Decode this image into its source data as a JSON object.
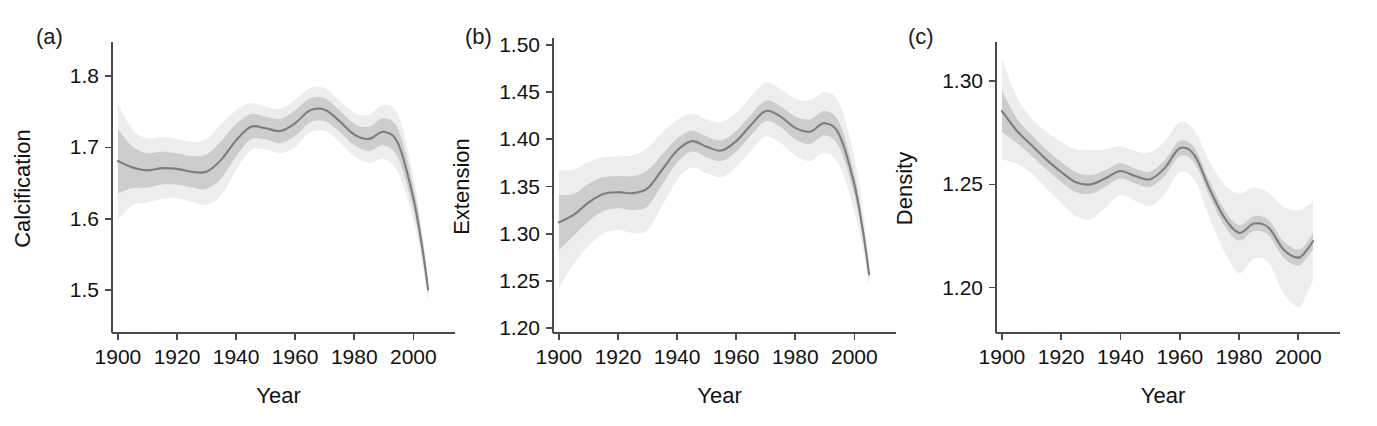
{
  "figure": {
    "title": "",
    "panel_count": 3,
    "background_color": "#ffffff",
    "line_color": "#7d7d7d",
    "inner_band_color": "#cdcdcd",
    "outer_band_color": "#ededed"
  },
  "chart_data": [
    {
      "type": "line",
      "panel_label": "(a)",
      "title": "",
      "xlabel": "Year",
      "ylabel": "Calcification",
      "xlim": [
        1898,
        2008
      ],
      "ylim": [
        1.44,
        1.845
      ],
      "xticks": [
        1900,
        1920,
        1940,
        1960,
        1980,
        2000
      ],
      "xticklabels": [
        "1900",
        "1920",
        "1940",
        "1960",
        "1980",
        "2000"
      ],
      "yticks": [
        1.5,
        1.6,
        1.7,
        1.8
      ],
      "yticklabels": [
        "1.5",
        "1.6",
        "1.7",
        "1.8"
      ],
      "grid": false,
      "legend": "none",
      "x": [
        1900,
        1905,
        1910,
        1915,
        1920,
        1925,
        1930,
        1935,
        1940,
        1945,
        1950,
        1955,
        1960,
        1965,
        1970,
        1975,
        1980,
        1985,
        1990,
        1995,
        2000,
        2003,
        2005
      ],
      "series": [
        {
          "name": "fit",
          "values": [
            1.681,
            1.672,
            1.668,
            1.671,
            1.67,
            1.666,
            1.666,
            1.683,
            1.71,
            1.729,
            1.727,
            1.723,
            1.734,
            1.752,
            1.753,
            1.737,
            1.718,
            1.712,
            1.722,
            1.704,
            1.629,
            1.56,
            1.501
          ]
        },
        {
          "name": "inner_lower",
          "values": [
            1.636,
            1.643,
            1.644,
            1.648,
            1.648,
            1.644,
            1.642,
            1.657,
            1.687,
            1.711,
            1.711,
            1.706,
            1.716,
            1.735,
            1.737,
            1.722,
            1.703,
            1.695,
            1.703,
            1.684,
            1.613,
            1.548,
            1.492
          ]
        },
        {
          "name": "inner_upper",
          "values": [
            1.726,
            1.701,
            1.692,
            1.694,
            1.692,
            1.688,
            1.69,
            1.709,
            1.733,
            1.747,
            1.743,
            1.74,
            1.752,
            1.769,
            1.769,
            1.752,
            1.733,
            1.729,
            1.741,
            1.724,
            1.645,
            1.572,
            1.51
          ]
        },
        {
          "name": "outer_lower",
          "values": [
            1.6,
            1.619,
            1.623,
            1.628,
            1.629,
            1.624,
            1.62,
            1.633,
            1.668,
            1.696,
            1.697,
            1.692,
            1.701,
            1.721,
            1.723,
            1.708,
            1.688,
            1.678,
            1.684,
            1.664,
            1.598,
            1.537,
            1.484
          ]
        },
        {
          "name": "outer_upper",
          "values": [
            1.762,
            1.725,
            1.713,
            1.715,
            1.712,
            1.708,
            1.712,
            1.733,
            1.752,
            1.762,
            1.757,
            1.754,
            1.767,
            1.783,
            1.783,
            1.766,
            1.748,
            1.746,
            1.76,
            1.744,
            1.66,
            1.583,
            1.518
          ]
        }
      ]
    },
    {
      "type": "line",
      "panel_label": "(b)",
      "title": "",
      "xlabel": "Year",
      "ylabel": "Extension",
      "xlim": [
        1898,
        2008
      ],
      "ylim": [
        1.195,
        1.505
      ],
      "xticks": [
        1900,
        1920,
        1940,
        1960,
        1980,
        2000
      ],
      "xticklabels": [
        "1900",
        "1920",
        "1940",
        "1960",
        "1980",
        "2000"
      ],
      "yticks": [
        1.2,
        1.25,
        1.3,
        1.35,
        1.4,
        1.45,
        1.5
      ],
      "yticklabels": [
        "1.20",
        "1.25",
        "1.30",
        "1.35",
        "1.40",
        "1.45",
        "1.50"
      ],
      "grid": false,
      "legend": "none",
      "x": [
        1900,
        1905,
        1910,
        1915,
        1920,
        1925,
        1930,
        1935,
        1940,
        1945,
        1950,
        1955,
        1960,
        1965,
        1970,
        1975,
        1980,
        1985,
        1990,
        1995,
        2000,
        2003,
        2005
      ],
      "series": [
        {
          "name": "fit",
          "values": [
            1.312,
            1.32,
            1.333,
            1.342,
            1.344,
            1.343,
            1.348,
            1.368,
            1.388,
            1.398,
            1.392,
            1.388,
            1.398,
            1.415,
            1.43,
            1.424,
            1.412,
            1.408,
            1.417,
            1.404,
            1.352,
            1.301,
            1.257
          ]
        },
        {
          "name": "inner_lower",
          "values": [
            1.283,
            1.298,
            1.313,
            1.324,
            1.327,
            1.325,
            1.329,
            1.352,
            1.375,
            1.387,
            1.381,
            1.377,
            1.387,
            1.404,
            1.419,
            1.413,
            1.4,
            1.395,
            1.404,
            1.391,
            1.341,
            1.293,
            1.252
          ]
        },
        {
          "name": "inner_upper",
          "values": [
            1.341,
            1.342,
            1.353,
            1.36,
            1.361,
            1.361,
            1.367,
            1.384,
            1.401,
            1.409,
            1.403,
            1.399,
            1.409,
            1.426,
            1.441,
            1.435,
            1.424,
            1.421,
            1.43,
            1.417,
            1.363,
            1.309,
            1.262
          ]
        },
        {
          "name": "outer_lower",
          "values": [
            1.243,
            1.268,
            1.287,
            1.3,
            1.304,
            1.301,
            1.304,
            1.33,
            1.357,
            1.37,
            1.364,
            1.36,
            1.37,
            1.388,
            1.403,
            1.396,
            1.383,
            1.377,
            1.386,
            1.372,
            1.324,
            1.281,
            1.244
          ]
        },
        {
          "name": "outer_upper",
          "values": [
            1.367,
            1.368,
            1.376,
            1.381,
            1.382,
            1.383,
            1.391,
            1.407,
            1.42,
            1.427,
            1.421,
            1.418,
            1.428,
            1.445,
            1.46,
            1.453,
            1.443,
            1.441,
            1.45,
            1.437,
            1.381,
            1.322,
            1.271
          ]
        }
      ]
    },
    {
      "type": "line",
      "panel_label": "(c)",
      "title": "",
      "xlabel": "Year",
      "ylabel": "Density",
      "xlim": [
        1898,
        2008
      ],
      "ylim": [
        1.178,
        1.318
      ],
      "xticks": [
        1900,
        1920,
        1940,
        1960,
        1980,
        2000
      ],
      "xticklabels": [
        "1900",
        "1920",
        "1940",
        "1960",
        "1980",
        "2000"
      ],
      "yticks": [
        1.2,
        1.25,
        1.3
      ],
      "yticklabels": [
        "1.20",
        "1.25",
        "1.30"
      ],
      "grid": false,
      "legend": "none",
      "x": [
        1900,
        1905,
        1910,
        1915,
        1920,
        1925,
        1930,
        1935,
        1940,
        1945,
        1950,
        1955,
        1960,
        1965,
        1970,
        1975,
        1980,
        1985,
        1990,
        1995,
        2000,
        2003,
        2005
      ],
      "series": [
        {
          "name": "fit",
          "values": [
            1.2855,
            1.276,
            1.269,
            1.262,
            1.256,
            1.251,
            1.25,
            1.253,
            1.2565,
            1.254,
            1.2525,
            1.258,
            1.2675,
            1.264,
            1.248,
            1.234,
            1.2265,
            1.231,
            1.229,
            1.2185,
            1.2145,
            1.2185,
            1.2225
          ]
        },
        {
          "name": "inner_lower",
          "values": [
            1.2755,
            1.27,
            1.264,
            1.2572,
            1.2512,
            1.2462,
            1.2455,
            1.249,
            1.2528,
            1.2504,
            1.2488,
            1.2542,
            1.2638,
            1.2604,
            1.2444,
            1.2302,
            1.2228,
            1.2274,
            1.2252,
            1.2146,
            1.2106,
            1.2148,
            1.2188
          ]
        },
        {
          "name": "inner_upper",
          "values": [
            1.2955,
            1.282,
            1.274,
            1.2668,
            1.2608,
            1.2558,
            1.2545,
            1.257,
            1.2602,
            1.2576,
            1.2562,
            1.2618,
            1.2712,
            1.2676,
            1.2516,
            1.2378,
            1.2302,
            1.2346,
            1.2328,
            1.2224,
            1.2184,
            1.2222,
            1.2262
          ]
        },
        {
          "name": "outer_lower",
          "values": [
            1.262,
            1.26,
            1.2555,
            1.248,
            1.241,
            1.2345,
            1.233,
            1.239,
            1.245,
            1.242,
            1.2395,
            1.2455,
            1.256,
            1.252,
            1.234,
            1.2175,
            1.207,
            1.214,
            1.212,
            1.1975,
            1.1905,
            1.1975,
            1.2035
          ]
        },
        {
          "name": "outer_upper",
          "values": [
            1.311,
            1.2925,
            1.282,
            1.2755,
            1.2705,
            1.267,
            1.2665,
            1.267,
            1.2685,
            1.266,
            1.2655,
            1.271,
            1.28,
            1.276,
            1.2615,
            1.25,
            1.2455,
            1.2485,
            1.246,
            1.239,
            1.2375,
            1.2395,
            1.242
          ]
        }
      ]
    }
  ]
}
